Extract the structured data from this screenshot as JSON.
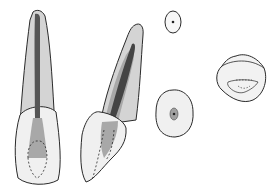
{
  "diagram": {
    "views": [
      {
        "id": "labial-view",
        "label": ""
      },
      {
        "id": "proximal-view",
        "label": ""
      },
      {
        "id": "cross-section-apical",
        "label": ""
      },
      {
        "id": "cross-section-cervical",
        "label": ""
      },
      {
        "id": "occlusal-view",
        "label": ""
      }
    ],
    "colors": {
      "outline": "#2a2a2a",
      "root": "#d4d4d4",
      "crown": "#f0f0f0",
      "pulp_chamber": "#a8a8a8",
      "canal": "#555555",
      "background": "#ffffff"
    }
  }
}
